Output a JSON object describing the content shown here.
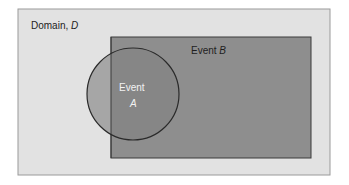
{
  "diagram": {
    "type": "venn",
    "domain": {
      "label": "Domain, ",
      "label_var": "D",
      "fill": "#e2e2e2",
      "stroke": "#9a9a9a"
    },
    "event_b": {
      "label": "Event ",
      "label_var": "B",
      "fill": "#8e8e8e",
      "stroke": "#3a3a3a"
    },
    "event_a": {
      "label": "Event",
      "label_var": "A",
      "fill": "#a6a6a6",
      "overlap_fill": "#868686",
      "stroke": "#2a2a2a",
      "text_color": "#f2f2f2"
    }
  }
}
